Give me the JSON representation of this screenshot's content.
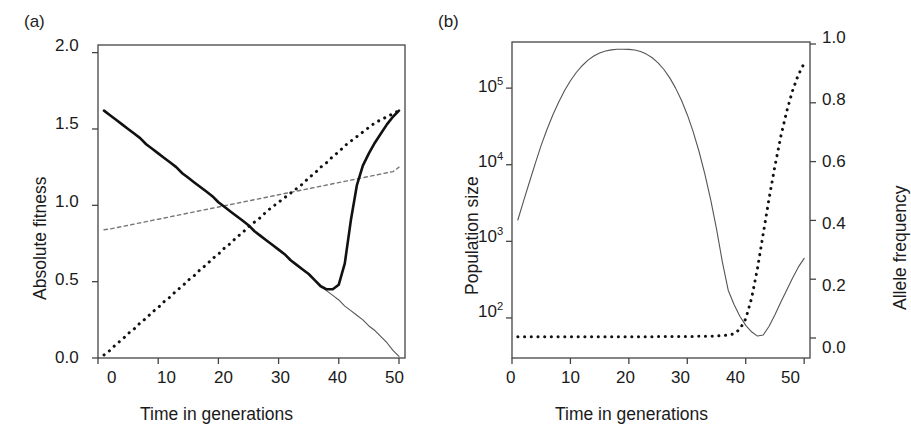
{
  "figure": {
    "panels": [
      {
        "tag": "(a)",
        "y_axis_label": "Absolute fitness",
        "x_axis_label": "Time in generations",
        "x_ticks": [
          "0",
          "10",
          "20",
          "30",
          "40",
          "50"
        ],
        "y_ticks": [
          "0.0",
          "0.5",
          "1.0",
          "1.5",
          "2.0"
        ]
      },
      {
        "tag": "(b)",
        "y_axis_label": "Population size",
        "y2_axis_label": "Allele frequency",
        "x_axis_label": "Time in generations",
        "x_ticks": [
          "0",
          "10",
          "20",
          "30",
          "40",
          "50"
        ],
        "y_ticks": [
          "10",
          "10",
          "10",
          "10"
        ],
        "y_tick_exponents": [
          "2",
          "3",
          "4",
          "5"
        ],
        "y2_ticks": [
          "0.0",
          "0.2",
          "0.4",
          "0.6",
          "0.8",
          "1.0"
        ]
      }
    ],
    "colors": {
      "axis": "#444444",
      "bold_line": "#111111",
      "thin_line": "#555555",
      "dotted_line": "#111111",
      "dashed_line": "#777777",
      "background": "#ffffff"
    }
  },
  "chart_data": [
    {
      "type": "line",
      "title": "(a) Absolute fitness over time",
      "xlabel": "Time in generations",
      "ylabel": "Absolute fitness",
      "xlim": [
        0,
        51
      ],
      "ylim": [
        0.0,
        2.05
      ],
      "yscale": "linear",
      "grid": false,
      "legend": "none",
      "x": [
        1,
        2,
        3,
        4,
        5,
        6,
        7,
        8,
        9,
        10,
        11,
        12,
        13,
        14,
        15,
        16,
        17,
        18,
        19,
        20,
        21,
        22,
        23,
        24,
        25,
        26,
        27,
        28,
        29,
        30,
        31,
        32,
        33,
        34,
        35,
        36,
        37,
        38,
        39,
        40,
        41,
        42,
        43,
        44,
        45,
        46,
        47,
        48,
        49,
        50
      ],
      "series": [
        {
          "name": "Mean absolute fitness of population (bold solid)",
          "style": "solid-bold",
          "values": [
            1.62,
            1.59,
            1.56,
            1.53,
            1.5,
            1.47,
            1.44,
            1.4,
            1.37,
            1.34,
            1.31,
            1.28,
            1.25,
            1.21,
            1.18,
            1.15,
            1.12,
            1.09,
            1.06,
            1.02,
            0.99,
            0.96,
            0.93,
            0.9,
            0.87,
            0.83,
            0.8,
            0.77,
            0.74,
            0.71,
            0.68,
            0.64,
            0.61,
            0.58,
            0.55,
            0.51,
            0.47,
            0.45,
            0.45,
            0.48,
            0.62,
            0.9,
            1.13,
            1.26,
            1.34,
            1.41,
            1.47,
            1.53,
            1.58,
            1.62
          ]
        },
        {
          "name": "Fitness of wild-type genotype (thin solid)",
          "style": "solid-thin",
          "values": [
            1.62,
            1.59,
            1.56,
            1.53,
            1.5,
            1.47,
            1.44,
            1.4,
            1.37,
            1.34,
            1.31,
            1.28,
            1.25,
            1.21,
            1.18,
            1.15,
            1.12,
            1.09,
            1.06,
            1.02,
            0.99,
            0.96,
            0.93,
            0.9,
            0.87,
            0.83,
            0.8,
            0.77,
            0.74,
            0.71,
            0.68,
            0.64,
            0.61,
            0.58,
            0.55,
            0.51,
            0.47,
            0.44,
            0.41,
            0.38,
            0.34,
            0.31,
            0.28,
            0.25,
            0.21,
            0.18,
            0.14,
            0.1,
            0.05,
            0.01
          ]
        },
        {
          "name": "Fitness of rescue genotype (bold dotted)",
          "style": "dotted-bold",
          "values": [
            0.02,
            0.05,
            0.09,
            0.12,
            0.16,
            0.19,
            0.23,
            0.26,
            0.3,
            0.33,
            0.37,
            0.4,
            0.44,
            0.47,
            0.51,
            0.54,
            0.58,
            0.61,
            0.65,
            0.68,
            0.72,
            0.75,
            0.79,
            0.82,
            0.86,
            0.89,
            0.92,
            0.96,
            0.99,
            1.02,
            1.05,
            1.08,
            1.11,
            1.14,
            1.18,
            1.21,
            1.25,
            1.28,
            1.32,
            1.35,
            1.39,
            1.42,
            1.45,
            1.48,
            1.51,
            1.54,
            1.56,
            1.58,
            1.6,
            1.62
          ]
        },
        {
          "name": "Environmental optimum reference (thin dashed)",
          "style": "dashed-thin",
          "values": [
            0.84,
            0.845,
            0.853,
            0.861,
            0.869,
            0.877,
            0.885,
            0.893,
            0.901,
            0.909,
            0.917,
            0.925,
            0.933,
            0.941,
            0.949,
            0.957,
            0.965,
            0.973,
            0.981,
            0.989,
            0.997,
            1.005,
            1.013,
            1.021,
            1.029,
            1.037,
            1.045,
            1.053,
            1.061,
            1.069,
            1.077,
            1.085,
            1.093,
            1.101,
            1.109,
            1.117,
            1.125,
            1.133,
            1.141,
            1.149,
            1.157,
            1.165,
            1.173,
            1.181,
            1.189,
            1.197,
            1.205,
            1.213,
            1.221,
            1.25
          ]
        }
      ]
    },
    {
      "type": "line",
      "title": "(b) Population size and allele frequency over time",
      "xlabel": "Time in generations",
      "ylabel": "Population size",
      "y2label": "Allele frequency",
      "xlim": [
        0,
        51
      ],
      "ylim": [
        30,
        400000
      ],
      "yscale": "log",
      "y2lim": [
        0.0,
        1.0
      ],
      "grid": false,
      "legend": "none",
      "x": [
        1,
        2,
        3,
        4,
        5,
        6,
        7,
        8,
        9,
        10,
        11,
        12,
        13,
        14,
        15,
        16,
        17,
        18,
        19,
        20,
        21,
        22,
        23,
        24,
        25,
        26,
        27,
        28,
        29,
        30,
        31,
        32,
        33,
        34,
        35,
        36,
        37,
        38,
        39,
        40,
        41,
        42,
        43,
        44,
        45,
        46,
        47,
        48,
        49,
        50
      ],
      "series": [
        {
          "name": "Population size (solid, left log axis)",
          "style": "solid-thin",
          "axis": "left",
          "values": [
            1900,
            3400,
            6000,
            10500,
            18000,
            29000,
            45000,
            66000,
            93000,
            125000,
            160000,
            196000,
            232000,
            263000,
            288000,
            305000,
            316000,
            321000,
            322000,
            320000,
            314000,
            300000,
            278000,
            249000,
            214000,
            175000,
            136000,
            100000,
            69500,
            45000,
            27000,
            15000,
            7600,
            3500,
            1450,
            540,
            230,
            150,
            105,
            80,
            66,
            58,
            60,
            78,
            110,
            160,
            230,
            330,
            460,
            600
          ]
        },
        {
          "name": "Rescue allele frequency (dotted, right axis)",
          "style": "dotted-bold",
          "axis": "right",
          "values": [
            0.004,
            0.004,
            0.004,
            0.004,
            0.004,
            0.004,
            0.004,
            0.004,
            0.004,
            0.004,
            0.004,
            0.004,
            0.004,
            0.004,
            0.004,
            0.004,
            0.004,
            0.004,
            0.004,
            0.004,
            0.004,
            0.004,
            0.004,
            0.004,
            0.005,
            0.005,
            0.005,
            0.005,
            0.005,
            0.005,
            0.005,
            0.006,
            0.006,
            0.006,
            0.007,
            0.008,
            0.01,
            0.014,
            0.03,
            0.065,
            0.135,
            0.235,
            0.355,
            0.475,
            0.585,
            0.685,
            0.77,
            0.84,
            0.895,
            0.935
          ]
        }
      ]
    }
  ]
}
